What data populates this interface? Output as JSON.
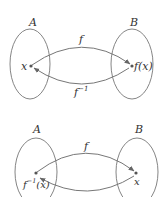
{
  "diagrams": [
    {
      "id": "top",
      "set_left_label": "A",
      "set_right_label": "B",
      "point_left_label": "x",
      "point_right_label": "f(x)",
      "arrow_top_label": "f",
      "arrow_bottom_label": "f",
      "arrow_bottom_sup": "−1"
    },
    {
      "id": "bottom",
      "set_left_label": "A",
      "set_right_label": "B",
      "point_left_label_base": "f",
      "point_left_label_sup": "−1",
      "point_left_label_arg": "(x)",
      "point_right_label": "x",
      "arrow_top_label": "f"
    }
  ],
  "colors": {
    "stroke": "#777777",
    "text": "#333333",
    "background": "#ffffff"
  }
}
